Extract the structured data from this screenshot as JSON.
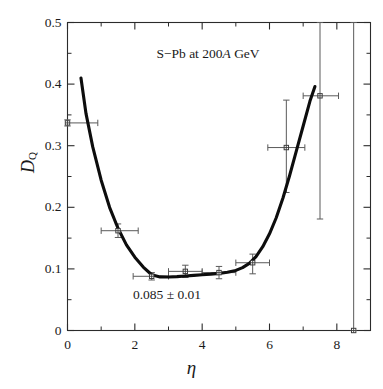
{
  "chart_data": {
    "type": "scatter",
    "title": "S−Pb at  200A GeV",
    "title_italic_part": "A",
    "xlabel": "η",
    "ylabel": "D",
    "ylabel_sub": "Q",
    "xlim": [
      0,
      9
    ],
    "ylim": [
      0,
      0.5
    ],
    "grid": false,
    "legend": "none",
    "xticks": [
      0,
      2,
      4,
      6,
      8
    ],
    "xtick_labels": [
      "0",
      "2",
      "4",
      "6",
      "8"
    ],
    "xminor_ticks": [
      1,
      3,
      5,
      7,
      9
    ],
    "yticks": [
      0,
      0.1,
      0.2,
      0.3,
      0.4,
      0.5
    ],
    "ytick_labels": [
      "0",
      "0.1",
      "0.2",
      "0.3",
      "0.4",
      "0.5"
    ],
    "yminor_ticks": [
      0.05,
      0.15,
      0.25,
      0.35,
      0.45
    ],
    "annotation": "0.085 ± 0.01",
    "marker": "open-square-with-cross",
    "series": [
      {
        "name": "D_Q data",
        "points": [
          {
            "x": 0.0,
            "y": 0.337,
            "xerr_low": 0.0,
            "xerr_high": 0.9,
            "yerr_low": 0.005,
            "yerr_high": 0.005
          },
          {
            "x": 1.5,
            "y": 0.162,
            "xerr_low": 0.5,
            "xerr_high": 0.6,
            "yerr_low": 0.011,
            "yerr_high": 0.011
          },
          {
            "x": 2.5,
            "y": 0.088,
            "xerr_low": 0.55,
            "xerr_high": 0.5,
            "yerr_low": 0.006,
            "yerr_high": 0.006
          },
          {
            "x": 3.5,
            "y": 0.096,
            "xerr_low": 0.5,
            "xerr_high": 0.5,
            "yerr_low": 0.01,
            "yerr_high": 0.01
          },
          {
            "x": 4.5,
            "y": 0.094,
            "xerr_low": 0.5,
            "xerr_high": 0.5,
            "yerr_low": 0.01,
            "yerr_high": 0.01
          },
          {
            "x": 5.5,
            "y": 0.11,
            "xerr_low": 0.5,
            "xerr_high": 0.5,
            "yerr_low": 0.018,
            "yerr_high": 0.014
          },
          {
            "x": 6.5,
            "y": 0.297,
            "xerr_low": 0.55,
            "xerr_high": 0.55,
            "yerr_low": 0.073,
            "yerr_high": 0.077
          },
          {
            "x": 7.5,
            "y": 0.381,
            "xerr_low": 0.5,
            "xerr_high": 0.55,
            "yerr_low": 0.2,
            "yerr_high": 0.12
          },
          {
            "x": 8.5,
            "y": 0.0,
            "xerr_low": 0.0,
            "xerr_high": 0.0,
            "yerr_low": 0.0,
            "yerr_high": 0.5
          }
        ]
      }
    ],
    "fit_curve": {
      "name": "fit",
      "x": [
        0.4,
        0.55,
        0.75,
        1.0,
        1.25,
        1.5,
        1.75,
        2.0,
        2.25,
        2.5,
        2.75,
        3.0,
        3.25,
        3.5,
        3.75,
        4.0,
        4.25,
        4.5,
        4.75,
        5.0,
        5.2,
        5.4,
        5.6,
        5.8,
        6.0,
        6.2,
        6.4,
        6.6,
        6.8,
        7.0,
        7.2,
        7.35
      ],
      "y": [
        0.41,
        0.352,
        0.298,
        0.244,
        0.2,
        0.166,
        0.139,
        0.119,
        0.103,
        0.0905,
        0.087,
        0.0868,
        0.0875,
        0.0885,
        0.0895,
        0.0905,
        0.0915,
        0.0928,
        0.0945,
        0.0975,
        0.102,
        0.109,
        0.12,
        0.136,
        0.157,
        0.183,
        0.215,
        0.252,
        0.292,
        0.332,
        0.372,
        0.396
      ]
    }
  }
}
